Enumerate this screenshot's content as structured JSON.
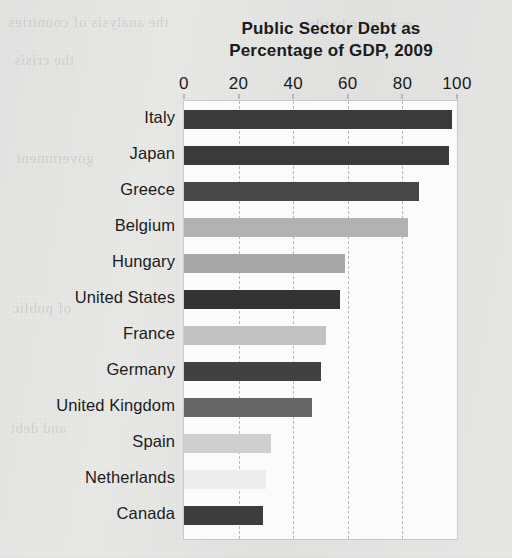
{
  "chart_data": {
    "type": "bar",
    "orientation": "horizontal",
    "title": "Public Sector Debt as Percentage of GDP, 2009",
    "title_lines": [
      "Public Sector Debt as",
      "Percentage of GDP, 2009"
    ],
    "xlabel": "",
    "ylabel": "",
    "xlim": [
      0,
      100
    ],
    "xticks": [
      0,
      20,
      40,
      60,
      80,
      100
    ],
    "xtick_labels": [
      "0",
      "20",
      "40",
      "60",
      "80",
      "100"
    ],
    "grid": "vertical-dashed",
    "legend": "none",
    "categories": [
      "Italy",
      "Japan",
      "Greece",
      "Belgium",
      "Hungary",
      "United States",
      "France",
      "Germany",
      "United Kingdom",
      "Spain",
      "Netherlands",
      "Canada"
    ],
    "values": [
      98,
      97,
      86,
      82,
      59,
      57,
      52,
      50,
      47,
      32,
      30,
      29
    ],
    "bar_colors": [
      "#3a3a3a",
      "#3a3a3a",
      "#474747",
      "#b2b2b2",
      "#a8a8a8",
      "#333333",
      "#c2c2c2",
      "#414141",
      "#666666",
      "#cfcfcf",
      "#ededed",
      "#3d3d3d"
    ],
    "bars": [
      {
        "label": "Italy",
        "value": 98,
        "color": "#3a3a3a"
      },
      {
        "label": "Japan",
        "value": 97,
        "color": "#3a3a3a"
      },
      {
        "label": "Greece",
        "value": 86,
        "color": "#474747"
      },
      {
        "label": "Belgium",
        "value": 82,
        "color": "#b2b2b2"
      },
      {
        "label": "Hungary",
        "value": 59,
        "color": "#a8a8a8"
      },
      {
        "label": "United States",
        "value": 57,
        "color": "#333333"
      },
      {
        "label": "France",
        "value": 52,
        "color": "#c2c2c2"
      },
      {
        "label": "Germany",
        "value": 50,
        "color": "#414141"
      },
      {
        "label": "United Kingdom",
        "value": 47,
        "color": "#666666"
      },
      {
        "label": "Spain",
        "value": 32,
        "color": "#cfcfcf"
      },
      {
        "label": "Netherlands",
        "value": 30,
        "color": "#ededed"
      },
      {
        "label": "Canada",
        "value": 29,
        "color": "#3d3d3d"
      }
    ]
  },
  "page": {
    "background_color": "#e8e8e6",
    "plot_background_color": "#fbfbfb",
    "gridline_color": "#b9b9b7",
    "text_color": "#1b1b1b"
  }
}
